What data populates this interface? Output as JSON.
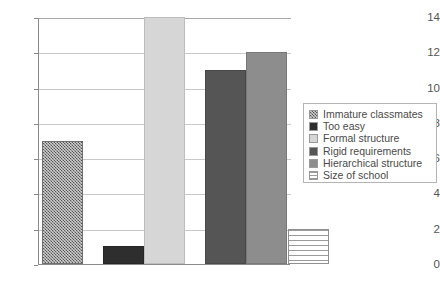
{
  "chart_data": {
    "type": "bar",
    "title": "",
    "subtitle": "",
    "xlabel": "",
    "ylabel": "",
    "ylim": [
      0,
      14
    ],
    "ytick_labels": [
      "14",
      "12",
      "10",
      "8",
      "6",
      "4",
      "2",
      "0"
    ],
    "ytick_values": [
      14,
      12,
      10,
      8,
      6,
      4,
      2,
      0
    ],
    "grid": true,
    "legend_position": "right",
    "categories": [
      "Immature classmates",
      "Too easy",
      "Formal structure",
      "Rigid requirements",
      "Hierarchical structure",
      "Size of school"
    ],
    "values": [
      7,
      1,
      14,
      11,
      12,
      2
    ],
    "bars": [
      {
        "label": "Immature classmates",
        "value": 7,
        "pattern": "crosshatch",
        "color": "#8e8e8e"
      },
      {
        "label": "Too easy",
        "value": 1,
        "pattern": "solid-darkest",
        "color": "#2e2e2e"
      },
      {
        "label": "Formal structure",
        "value": 14,
        "pattern": "solid-light",
        "color": "#d6d6d6"
      },
      {
        "label": "Rigid requirements",
        "value": 11,
        "pattern": "solid-dark",
        "color": "#555555"
      },
      {
        "label": "Hierarchical structure",
        "value": 12,
        "pattern": "solid-medium",
        "color": "#8d8d8d"
      },
      {
        "label": "Size of school",
        "value": 2,
        "pattern": "hlines",
        "color": "#ffffff"
      }
    ],
    "annotations": []
  },
  "legend": {
    "items": [
      {
        "label": "Immature classmates",
        "pattern": "crosshatch"
      },
      {
        "label": "Too easy",
        "pattern": "solid-darkest"
      },
      {
        "label": "Formal structure",
        "pattern": "solid-light"
      },
      {
        "label": "Rigid requirements",
        "pattern": "solid-dark"
      },
      {
        "label": "Hierarchical structure",
        "pattern": "solid-medium"
      },
      {
        "label": "Size of school",
        "pattern": "hlines"
      }
    ]
  },
  "style": {
    "axis_color": "#8a8a8a",
    "grid_color": "#c9c9c9",
    "text_color": "#555555",
    "background": "#ffffff"
  }
}
